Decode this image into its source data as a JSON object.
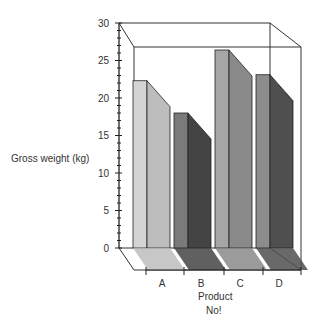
{
  "chart_data": {
    "type": "bar",
    "style": "3d",
    "title": "",
    "xlabel": "Product No!",
    "xlabel_lines": [
      "Product",
      "No!"
    ],
    "ylabel": "Gross weight (kg)",
    "categories": [
      "A",
      "B",
      "C",
      "D"
    ],
    "values": [
      22.3,
      18,
      26.4,
      23.1
    ],
    "ylim": [
      0,
      30
    ],
    "yticks": [
      0,
      5,
      10,
      15,
      20,
      25,
      30
    ],
    "grid": false,
    "legend": null,
    "colors": {
      "A": {
        "front": "#d4d4d4",
        "side": "#bdbdbd"
      },
      "B": {
        "front": "#7a7a7a",
        "side": "#444444"
      },
      "C": {
        "front": "#a6a6a6",
        "side": "#8a8a8a"
      },
      "D": {
        "front": "#8c8c8c",
        "side": "#4f4f4f"
      }
    }
  }
}
